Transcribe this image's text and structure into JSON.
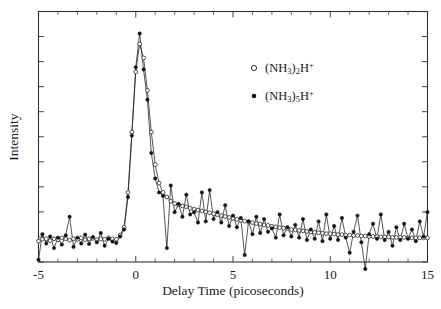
{
  "chart_data": {
    "type": "line",
    "title": "",
    "subtitle": "",
    "xlabel": "Delay Time (picoseconds)",
    "ylabel": "Intensity",
    "xlim": [
      -5,
      15
    ],
    "ylim": [
      0,
      1.08
    ],
    "grid": false,
    "x_major_ticks": [
      -5,
      0,
      5,
      10,
      15
    ],
    "x_major_tick_labels": [
      "-5",
      "0",
      "5",
      "10",
      "15"
    ],
    "x_minor_tick_interval": 1,
    "y_tick_count": 10,
    "y_tick_labels": [],
    "legend_position": "upper-right-inside",
    "axis_color": "#303030",
    "line_color": "#1d1d1d",
    "series": [
      {
        "name": "(NH3)2H+",
        "label_parts": {
          "prefix": "(NH",
          "sub1": "3",
          "mid": ")",
          "sub2": "2",
          "suffix": "H",
          "charge": "+"
        },
        "marker": "open-circle",
        "x": [
          -5.0,
          -4.8,
          -4.6,
          -4.4,
          -4.2,
          -4.0,
          -3.8,
          -3.6,
          -3.4,
          -3.2,
          -3.0,
          -2.8,
          -2.6,
          -2.4,
          -2.2,
          -2.0,
          -1.8,
          -1.6,
          -1.4,
          -1.2,
          -1.0,
          -0.8,
          -0.6,
          -0.4,
          -0.2,
          0.0,
          0.2,
          0.4,
          0.6,
          0.8,
          1.0,
          1.2,
          1.4,
          1.6,
          1.8,
          2.0,
          2.2,
          2.4,
          2.6,
          2.8,
          3.0,
          3.2,
          3.4,
          3.6,
          3.8,
          4.0,
          4.2,
          4.4,
          4.6,
          4.8,
          5.0,
          5.2,
          5.4,
          5.6,
          5.8,
          6.0,
          6.2,
          6.4,
          6.6,
          6.8,
          7.0,
          7.2,
          7.4,
          7.6,
          7.8,
          8.0,
          8.2,
          8.4,
          8.6,
          8.8,
          9.0,
          9.2,
          9.4,
          9.6,
          9.8,
          10.0,
          10.2,
          10.4,
          10.6,
          10.8,
          11.0,
          11.2,
          11.4,
          11.6,
          11.8,
          12.0,
          12.2,
          12.4,
          12.6,
          12.8,
          13.0,
          13.2,
          13.4,
          13.6,
          13.8,
          14.0,
          14.2,
          14.4,
          14.6,
          14.8,
          15.0
        ],
        "y": [
          0.09,
          0.098,
          0.1,
          0.092,
          0.1,
          0.096,
          0.104,
          0.1,
          0.094,
          0.1,
          0.098,
          0.104,
          0.096,
          0.1,
          0.102,
          0.096,
          0.1,
          0.098,
          0.104,
          0.1,
          0.098,
          0.116,
          0.15,
          0.3,
          0.56,
          0.82,
          0.94,
          0.88,
          0.74,
          0.56,
          0.42,
          0.34,
          0.3,
          0.28,
          0.262,
          0.252,
          0.246,
          0.242,
          0.238,
          0.232,
          0.228,
          0.224,
          0.22,
          0.216,
          0.212,
          0.208,
          0.204,
          0.2,
          0.196,
          0.192,
          0.188,
          0.184,
          0.18,
          0.176,
          0.174,
          0.17,
          0.166,
          0.164,
          0.16,
          0.158,
          0.154,
          0.152,
          0.148,
          0.146,
          0.144,
          0.14,
          0.138,
          0.136,
          0.134,
          0.132,
          0.13,
          0.128,
          0.126,
          0.124,
          0.122,
          0.122,
          0.12,
          0.118,
          0.118,
          0.116,
          0.116,
          0.114,
          0.114,
          0.112,
          0.112,
          0.11,
          0.11,
          0.11,
          0.108,
          0.108,
          0.108,
          0.106,
          0.106,
          0.106,
          0.106,
          0.104,
          0.104,
          0.104,
          0.104,
          0.104,
          0.104
        ]
      },
      {
        "name": "(NH3)5H+",
        "label_parts": {
          "prefix": "(NH",
          "sub1": "3",
          "mid": ")",
          "sub2": "5",
          "suffix": "H",
          "charge": "+"
        },
        "marker": "filled-circle",
        "x": [
          -5.0,
          -4.8,
          -4.6,
          -4.4,
          -4.2,
          -4.0,
          -3.8,
          -3.6,
          -3.4,
          -3.2,
          -3.0,
          -2.8,
          -2.6,
          -2.4,
          -2.2,
          -2.0,
          -1.8,
          -1.6,
          -1.4,
          -1.2,
          -1.0,
          -0.8,
          -0.6,
          -0.4,
          -0.2,
          0.0,
          0.2,
          0.4,
          0.6,
          0.8,
          1.0,
          1.2,
          1.4,
          1.6,
          1.8,
          2.0,
          2.2,
          2.4,
          2.6,
          2.8,
          3.0,
          3.2,
          3.4,
          3.6,
          3.8,
          4.0,
          4.2,
          4.4,
          4.6,
          4.8,
          5.0,
          5.2,
          5.4,
          5.6,
          5.8,
          6.0,
          6.2,
          6.4,
          6.6,
          6.8,
          7.0,
          7.2,
          7.4,
          7.6,
          7.8,
          8.0,
          8.2,
          8.4,
          8.6,
          8.8,
          9.0,
          9.2,
          9.4,
          9.6,
          9.8,
          10.0,
          10.2,
          10.4,
          10.6,
          10.8,
          11.0,
          11.2,
          11.4,
          11.6,
          11.8,
          12.0,
          12.2,
          12.4,
          12.6,
          12.8,
          13.0,
          13.2,
          13.4,
          13.6,
          13.8,
          14.0,
          14.2,
          14.4,
          14.6,
          14.8,
          15.0
        ],
        "y": [
          0.01,
          0.12,
          0.08,
          0.11,
          0.06,
          0.105,
          0.075,
          0.115,
          0.195,
          0.065,
          0.105,
          0.08,
          0.118,
          0.078,
          0.108,
          0.085,
          0.125,
          0.07,
          0.1,
          0.088,
          0.082,
          0.11,
          0.14,
          0.28,
          0.545,
          0.84,
          0.985,
          0.83,
          0.7,
          0.47,
          0.36,
          0.3,
          0.285,
          0.06,
          0.33,
          0.215,
          0.25,
          0.195,
          0.29,
          0.205,
          0.215,
          0.17,
          0.3,
          0.175,
          0.31,
          0.185,
          0.215,
          0.17,
          0.245,
          0.155,
          0.2,
          0.15,
          0.19,
          0.03,
          0.175,
          0.12,
          0.195,
          0.125,
          0.185,
          0.13,
          0.145,
          0.105,
          0.205,
          0.115,
          0.15,
          0.11,
          0.16,
          0.105,
          0.185,
          0.095,
          0.14,
          0.1,
          0.175,
          0.09,
          0.205,
          0.1,
          0.155,
          0.095,
          0.19,
          0.105,
          0.04,
          0.13,
          0.2,
          0.085,
          -0.03,
          0.12,
          0.165,
          0.1,
          0.205,
          0.095,
          0.13,
          0.07,
          0.15,
          0.095,
          0.165,
          0.1,
          0.14,
          0.09,
          0.175,
          0.11,
          0.215
        ]
      }
    ]
  },
  "legend": {
    "entries": [
      {
        "marker": "open-circle",
        "text": "(NH3)2H+"
      },
      {
        "marker": "filled-circle",
        "text": "(NH3)5H+"
      }
    ]
  }
}
